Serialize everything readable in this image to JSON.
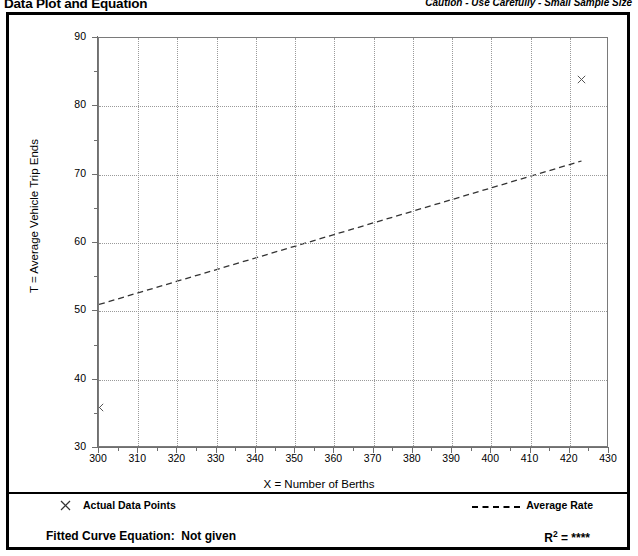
{
  "header": {
    "title": "Data Plot and Equation",
    "caution": "Caution - Use Carefully - Small Sample Size"
  },
  "legend": {
    "points_marker_icon": "x-marker-icon",
    "points_label": "Actual Data Points",
    "line_marker_icon": "dashed-line-icon",
    "line_label": "Average Rate"
  },
  "equation": {
    "label": "Fitted Curve Equation:",
    "value": "Not given",
    "r2_label": "R",
    "r2_exponent": "2",
    "r2_equals": "= ****"
  },
  "chart_data": {
    "type": "scatter",
    "title": "Data Plot and Equation",
    "xlabel": "X = Number of Berths",
    "ylabel": "T = Average Vehicle Trip Ends",
    "xlim": [
      300,
      430
    ],
    "ylim": [
      30,
      90
    ],
    "xticks": [
      300,
      310,
      320,
      330,
      340,
      350,
      360,
      370,
      380,
      390,
      400,
      410,
      420,
      430
    ],
    "yticks": [
      30,
      40,
      50,
      60,
      70,
      80,
      90
    ],
    "xminor_step": 5,
    "yminor_step": 5,
    "grid": true,
    "legend_position": "below-plot",
    "series": [
      {
        "name": "Actual Data Points",
        "type": "scatter",
        "marker": "x",
        "color": "#555555",
        "points": [
          {
            "x": 300,
            "y": 36
          },
          {
            "x": 423,
            "y": 84
          }
        ]
      },
      {
        "name": "Average Rate",
        "type": "line",
        "style": "dashed",
        "color": "#333333",
        "points": [
          {
            "x": 300,
            "y": 51
          },
          {
            "x": 423,
            "y": 72
          }
        ]
      }
    ]
  }
}
